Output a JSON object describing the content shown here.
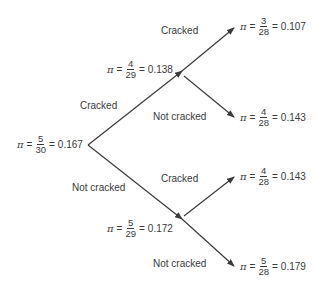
{
  "diagram": {
    "type": "probability-tree",
    "symbol": "π",
    "eq": "=",
    "root": {
      "num": "5",
      "den": "30",
      "value": "0.167"
    },
    "branch_labels": {
      "first_up": "Cracked",
      "first_down": "Not cracked",
      "upper_up": "Cracked",
      "upper_down": "Not cracked",
      "lower_up": "Cracked",
      "lower_down": "Not cracked"
    },
    "nodes": {
      "upper": {
        "num": "4",
        "den": "29",
        "value": "0.138"
      },
      "lower": {
        "num": "5",
        "den": "29",
        "value": "0.172"
      }
    },
    "leaves": [
      {
        "num": "3",
        "den": "28",
        "value": "0.107"
      },
      {
        "num": "4",
        "den": "28",
        "value": "0.143"
      },
      {
        "num": "4",
        "den": "28",
        "value": "0.143"
      },
      {
        "num": "5",
        "den": "28",
        "value": "0.179"
      }
    ],
    "line_color": "#3a3a3a"
  }
}
